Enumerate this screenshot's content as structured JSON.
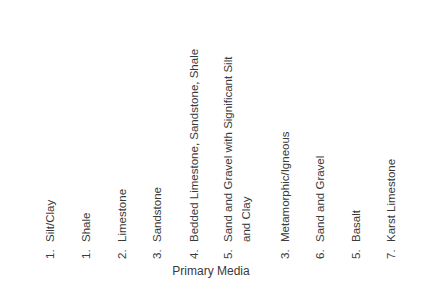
{
  "axis_title": "Primary Media",
  "columns": [
    {
      "num": "1.",
      "text": "Silt/Clay"
    },
    {
      "num": "1.",
      "text": "Shale"
    },
    {
      "num": "2.",
      "text": "Limestone"
    },
    {
      "num": "3.",
      "text": "Sandstone"
    },
    {
      "num": "4.",
      "text": "Bedded Limestone, Sandstone, Shale"
    },
    {
      "num": "5.",
      "text": "Sand and Gravel with Significant Silt",
      "text2": "and Clay"
    },
    {
      "num": "3.",
      "text": "Metamorphic/Igneous"
    },
    {
      "num": "6.",
      "text": "Sand and Gravel"
    },
    {
      "num": "5.",
      "text": "Basalt"
    },
    {
      "num": "7.",
      "text": "Karst Limestone"
    }
  ]
}
